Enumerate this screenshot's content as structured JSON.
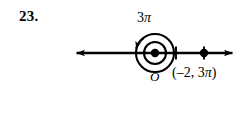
{
  "problem": {
    "number": "23."
  },
  "figure": {
    "type": "polar-coordinate-number-line",
    "angle_label": {
      "coefficient": "3",
      "symbol": "π",
      "full": "3π"
    },
    "origin_label": "O",
    "point_label": {
      "full": "(–2, 3π)",
      "open_paren": "(",
      "r": "–2",
      "separator": ", ",
      "theta_coefficient": "3",
      "theta_symbol": "π",
      "close_paren": ")"
    },
    "colors": {
      "ink": "#000000",
      "background": "#ffffff"
    },
    "geometry": {
      "axis_y": 53,
      "axis_x_start": 68,
      "axis_x_end": 241,
      "origin_x": 155,
      "origin_y": 53,
      "origin_dot_radius": 4.2,
      "inner_circle_radius": 11,
      "outer_circle_radius": 19,
      "tick_x": 176,
      "plotted_point_x": 204,
      "plotted_point_radius": 4.2,
      "rotation_direction": "counterclockwise"
    }
  }
}
